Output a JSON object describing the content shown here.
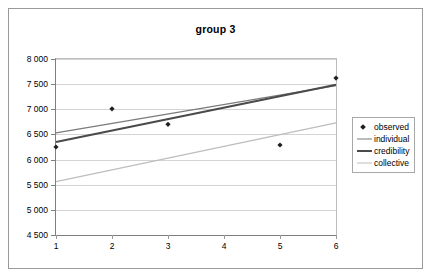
{
  "chart_data": {
    "type": "scatter",
    "title": "group 3",
    "xlabel": "",
    "ylabel": "",
    "x": [
      1,
      2,
      3,
      4,
      5,
      6
    ],
    "xtick_labels": [
      "1",
      "2",
      "3",
      "4",
      "5",
      "6"
    ],
    "xlim": [
      1,
      6
    ],
    "ylim": [
      4500,
      8000
    ],
    "ytick_labels": [
      "4 500",
      "5 000",
      "5 500",
      "6 000",
      "6 500",
      "7 000",
      "7 500",
      "8 000"
    ],
    "ytick_values": [
      4500,
      5000,
      5500,
      6000,
      6500,
      7000,
      7500,
      8000
    ],
    "grid": true,
    "legend_position": "right",
    "series": [
      {
        "name": "observed",
        "type": "scatter",
        "marker": "diamond",
        "color": "#1f1f1f",
        "x": [
          1,
          2,
          3,
          5,
          6
        ],
        "values": [
          6250,
          7010,
          6700,
          6290,
          7620
        ]
      },
      {
        "name": "individual",
        "type": "line",
        "color": "#7b7b7b",
        "width": 1.4,
        "x": [
          1,
          6
        ],
        "values": [
          6530,
          7470
        ]
      },
      {
        "name": "credibility",
        "type": "line",
        "color": "#4a4a4a",
        "width": 2.0,
        "x": [
          1,
          6
        ],
        "values": [
          6350,
          7490
        ]
      },
      {
        "name": "collective",
        "type": "line",
        "color": "#bdbdbd",
        "width": 1.2,
        "x": [
          1,
          6
        ],
        "values": [
          5560,
          6730
        ]
      }
    ],
    "legend_entries": [
      {
        "label": "observed",
        "key": "diamond-marker",
        "color": "#1f1f1f"
      },
      {
        "label": "individual",
        "key": "line",
        "color": "#7b7b7b"
      },
      {
        "label": "credibility",
        "key": "line-thick",
        "color": "#4a4a4a"
      },
      {
        "label": "collective",
        "key": "line-light",
        "color": "#bdbdbd"
      }
    ]
  }
}
